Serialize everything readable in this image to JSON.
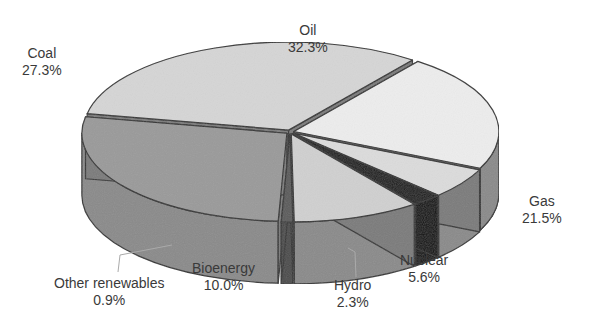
{
  "chart_data": {
    "type": "pie",
    "style": "3d-exploded",
    "title": "",
    "categories": [
      "Oil",
      "Gas",
      "Nuclear",
      "Hydro",
      "Bioenergy",
      "Other renewables",
      "Coal"
    ],
    "values": [
      32.3,
      21.5,
      5.6,
      2.3,
      10.0,
      0.9,
      27.3
    ],
    "unit": "%",
    "colors": {
      "Oil": "#d6d6d6",
      "Gas": "#ededed",
      "Nuclear": "#dcdcdc",
      "Hydro": "#1a1a1a",
      "Bioenergy": "#d0d0d0",
      "Other renewables": "#5a5a5a",
      "Coal": "#9a9a9a"
    },
    "legend": "none (direct labels)"
  },
  "labels": {
    "oil": {
      "name": "Oil",
      "value": "32.3%"
    },
    "gas": {
      "name": "Gas",
      "value": "21.5%"
    },
    "nuclear": {
      "name": "Nuclear",
      "value": "5.6%"
    },
    "hydro": {
      "name": "Hydro",
      "value": "2.3%"
    },
    "bioenergy": {
      "name": "Bioenergy",
      "value": "10.0%"
    },
    "other": {
      "name": "Other renewables",
      "value": "0.9%"
    },
    "coal": {
      "name": "Coal",
      "value": "27.3%"
    }
  }
}
